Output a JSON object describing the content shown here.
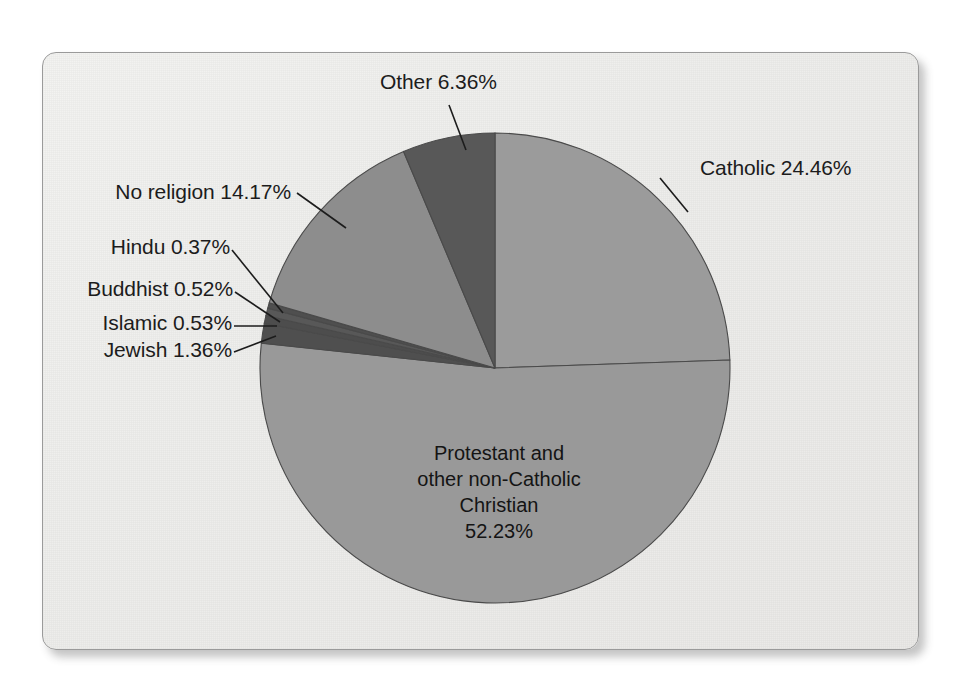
{
  "figure": {
    "background_color": "#ffffff",
    "panel_color": "#efefed",
    "panel_border_color": "#9a9a9a"
  },
  "chart_data": {
    "type": "pie",
    "title": "",
    "subtitle": "",
    "xlabel": "",
    "ylabel": "",
    "legend_position": "none",
    "grid": false,
    "start_angle_deg": 0,
    "direction": "clockwise",
    "units": "percent",
    "categories": [
      "Catholic",
      "Protestant and other non-Catholic Christian",
      "Jewish",
      "Islamic",
      "Buddhist",
      "Hindu",
      "No religion",
      "Other"
    ],
    "values": [
      24.46,
      52.23,
      1.36,
      0.53,
      0.52,
      0.37,
      14.17,
      6.36
    ],
    "colors": [
      "#9b9b9b",
      "#999999",
      "#4f4f4f",
      "#4d4d4d",
      "#585858",
      "#4f4f4f",
      "#8d8d8d",
      "#585858"
    ],
    "slices": [
      {
        "name": "Catholic",
        "label": "Catholic 24.46%",
        "value": 24.46,
        "color": "#9b9b9b",
        "label_placement": "outside-right",
        "leader_line": true
      },
      {
        "name": "Protestant and other non-Catholic Christian",
        "label": "Protestant and other non-Catholic Christian 52.23%",
        "value": 52.23,
        "color": "#999999",
        "label_placement": "inside",
        "leader_line": false
      },
      {
        "name": "Jewish",
        "label": "Jewish 1.36%",
        "value": 1.36,
        "color": "#4f4f4f",
        "label_placement": "outside-left",
        "leader_line": true
      },
      {
        "name": "Islamic",
        "label": "Islamic 0.53%",
        "value": 0.53,
        "color": "#4d4d4d",
        "label_placement": "outside-left",
        "leader_line": true
      },
      {
        "name": "Buddhist",
        "label": "Buddhist 0.52%",
        "value": 0.52,
        "color": "#585858",
        "label_placement": "outside-left",
        "leader_line": true
      },
      {
        "name": "Hindu",
        "label": "Hindu 0.37%",
        "value": 0.37,
        "color": "#4f4f4f",
        "label_placement": "outside-left",
        "leader_line": true
      },
      {
        "name": "No religion",
        "label": "No religion 14.17%",
        "value": 14.17,
        "color": "#8d8d8d",
        "label_placement": "outside-left",
        "leader_line": true
      },
      {
        "name": "Other",
        "label": "Other 6.36%",
        "value": 6.36,
        "color": "#585858",
        "label_placement": "outside-top",
        "leader_line": true
      }
    ]
  },
  "labels": {
    "other": "Other 6.36%",
    "catholic": "Catholic 24.46%",
    "no_religion": "No religion 14.17%",
    "hindu": "Hindu 0.37%",
    "buddhist": "Buddhist 0.52%",
    "islamic": "Islamic 0.53%",
    "jewish": "Jewish 1.36%",
    "protestant_line1": "Protestant and",
    "protestant_line2": "other non-Catholic",
    "protestant_line3": "Christian",
    "protestant_line4": "52.23%"
  }
}
